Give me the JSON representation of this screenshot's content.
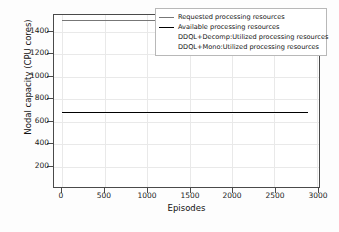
{
  "chart_data": {
    "type": "line",
    "title": "",
    "xlabel": "Episodes",
    "ylabel": "Nodal capacity (CPU cores)",
    "xlim": [
      -100,
      3050
    ],
    "ylim": [
      0,
      1550
    ],
    "xticks": [
      0,
      500,
      1000,
      1500,
      2000,
      2500,
      3000
    ],
    "yticks": [
      200,
      400,
      600,
      800,
      1000,
      1200,
      1400
    ],
    "grid": true,
    "legend_position": "upper right",
    "x": [
      0,
      2900
    ],
    "series": [
      {
        "name": "Requested processing  resources",
        "color": "#777777",
        "linewidth": 1.2,
        "values": [
          1500,
          1500
        ]
      },
      {
        "name": "Available processing  resources",
        "color": "#000000",
        "linewidth": 1.6,
        "values": [
          675,
          675
        ]
      },
      {
        "name": "DDQL+Decomp:Utilized processing  resources",
        "color": "#ffffff",
        "linewidth": 0.8,
        "values": [
          675,
          675
        ]
      },
      {
        "name": "DDQL+Mono:Utilized processing  resources",
        "color": "#ffffff",
        "linewidth": 0.8,
        "values": [
          675,
          675
        ]
      }
    ]
  },
  "legend": {
    "entries": [
      "Requested processing  resources",
      "Available processing  resources",
      "DDQL+Decomp:Utilized processing  resources",
      "DDQL+Mono:Utilized processing  resources"
    ]
  },
  "axes": {
    "ylabel": "Nodal capacity (CPU cores)",
    "xlabel": "Episodes",
    "ytick_labels": [
      "1400",
      "1200",
      "1000",
      "800",
      "600",
      "400",
      "200"
    ],
    "xtick_labels": [
      "0",
      "500",
      "1000",
      "1500",
      "2000",
      "2500",
      "3000"
    ]
  },
  "colors": {
    "frame": "#4a4a4a",
    "grid": "#e9e9e9",
    "background": "#ffffff",
    "text": "#111111"
  }
}
